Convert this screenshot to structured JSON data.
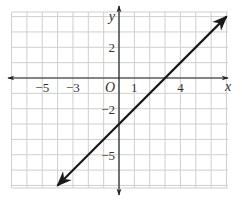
{
  "chart_data": {
    "type": "line",
    "title": "",
    "xlabel": "x",
    "ylabel": "y",
    "origin_label": "O",
    "xlim": [
      -7,
      7
    ],
    "ylim": [
      -7,
      4
    ],
    "grid": true,
    "x_tick_labels": [
      {
        "value": -5,
        "label": "−5"
      },
      {
        "value": -3,
        "label": "−3"
      },
      {
        "value": 1,
        "label": "1"
      },
      {
        "value": 4,
        "label": "4"
      }
    ],
    "y_tick_labels": [
      {
        "value": 2,
        "label": "2"
      },
      {
        "value": -2,
        "label": "−2"
      },
      {
        "value": -5,
        "label": "−5"
      }
    ],
    "series": [
      {
        "name": "y = x - 3",
        "slope": 1,
        "intercept": -3,
        "x": [
          -4,
          7
        ],
        "y": [
          -7,
          4
        ],
        "arrows": "both",
        "color": "#1a1a1a"
      }
    ],
    "colors": {
      "grid": "#cfcfcf",
      "axis": "#222222",
      "line": "#1a1a1a"
    }
  }
}
